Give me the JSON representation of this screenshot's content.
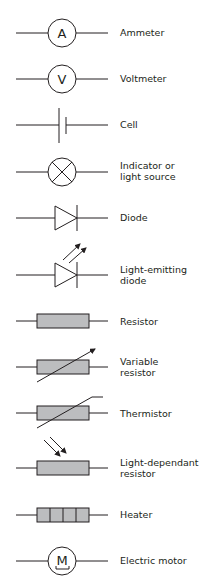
{
  "colors": {
    "line": "#231f20",
    "resistor_fill": "#bcbdbf",
    "background": "#ffffff"
  },
  "symbols": [
    {
      "id": "ammeter",
      "label": "Ammeter",
      "glyph": "A"
    },
    {
      "id": "voltmeter",
      "label": "Voltmeter",
      "glyph": "V"
    },
    {
      "id": "cell",
      "label": "Cell"
    },
    {
      "id": "indicator",
      "label": "Indicator or light source",
      "label_lines": [
        "Indicator or",
        "light source"
      ]
    },
    {
      "id": "diode",
      "label": "Diode"
    },
    {
      "id": "led",
      "label": "Light-emitting diode",
      "label_lines": [
        "Light-emitting",
        "diode"
      ]
    },
    {
      "id": "resistor",
      "label": "Resistor"
    },
    {
      "id": "variable-resistor",
      "label": "Variable resistor",
      "label_lines": [
        "Variable",
        "resistor"
      ]
    },
    {
      "id": "thermistor",
      "label": "Thermistor"
    },
    {
      "id": "ldr",
      "label": "Light-dependant resistor",
      "label_lines": [
        "Light-dependant",
        "resistor"
      ]
    },
    {
      "id": "heater",
      "label": "Heater"
    },
    {
      "id": "motor",
      "label": "Electric motor",
      "glyph": "M"
    }
  ]
}
